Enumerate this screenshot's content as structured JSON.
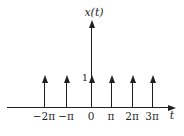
{
  "figure": {
    "ylabel": "x(t)",
    "xlabel": "t",
    "amplitude_label": "1"
  },
  "chart_data": {
    "type": "stem",
    "xlabel": "t",
    "ylabel": "x(t)",
    "categories": [
      "−2π",
      "−π",
      "0",
      "π",
      "2π",
      "3π"
    ],
    "x_in_units_of_pi": [
      -2,
      -1,
      0,
      1,
      2,
      3
    ],
    "values": [
      1,
      1,
      1,
      1,
      1,
      1
    ],
    "ylim": [
      0,
      1
    ],
    "marker": "upward-arrow-impulse",
    "annotations": [
      "1"
    ],
    "grid": false,
    "legend": false
  },
  "colors": {
    "line": "#1f1f1f",
    "text": "#1f1f1f",
    "background": "#ffffff"
  }
}
